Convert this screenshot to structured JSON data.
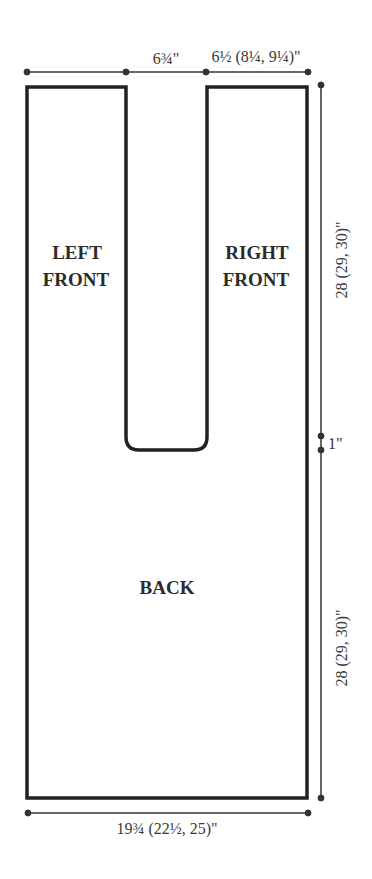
{
  "diagram": {
    "type": "knitting schematic",
    "colors": {
      "outline": "#222222",
      "dimension": "#333333",
      "background": "#ffffff"
    },
    "pieces": [
      {
        "name": "left-front",
        "label_lines": [
          "LEFT",
          "FRONT"
        ]
      },
      {
        "name": "right-front",
        "label_lines": [
          "RIGHT",
          "FRONT"
        ]
      },
      {
        "name": "back",
        "label_lines": [
          "BACK"
        ]
      }
    ],
    "dimensions": {
      "top_gap": "6¾\"",
      "top_right_width": "6½ (8¼, 9¼)\"",
      "upper_length": "28 (29, 30)\"",
      "gap": "1\"",
      "lower_length": "28 (29, 30)\"",
      "bottom_width": "19¾ (22½, 25)\""
    }
  }
}
